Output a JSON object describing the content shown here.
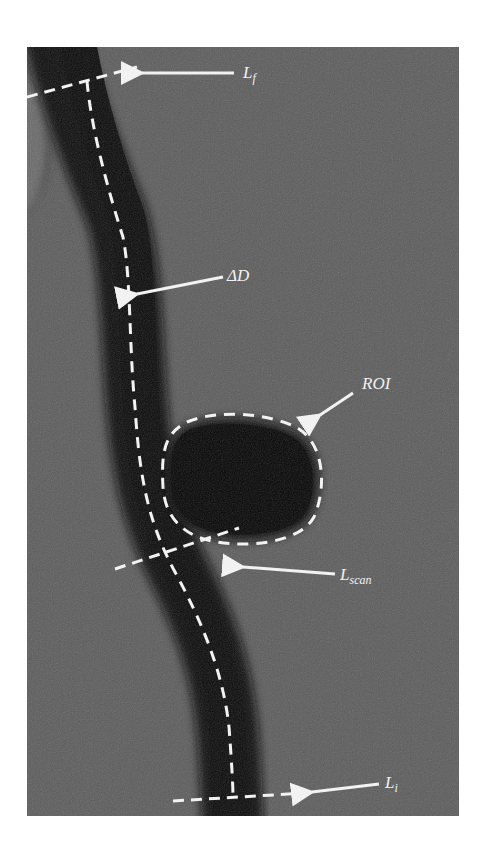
{
  "figure": {
    "background_color": "#5c5c5c",
    "vessel_color": "#111111",
    "annotation_color": "#f2f2f2",
    "labels": {
      "lf": {
        "main": "L",
        "sub": "f"
      },
      "delta_d": {
        "main": "ΔD"
      },
      "roi": {
        "main": "ROI"
      },
      "lscan": {
        "main": "L",
        "sub": "scan"
      },
      "li": {
        "main": "L",
        "sub": "i"
      }
    }
  }
}
